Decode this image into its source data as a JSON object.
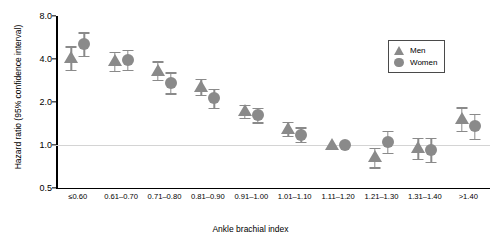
{
  "chart_data": {
    "type": "scatter",
    "title": "",
    "xlabel": "Ankle brachial index",
    "ylabel": "Hazard ratio (95% confidence interval)",
    "yscale": "log",
    "ylim": [
      0.5,
      8.0
    ],
    "yticks": [
      0.5,
      1.0,
      2.0,
      4.0,
      8.0
    ],
    "ytick_labels": [
      "0.5",
      "1.0",
      "2.0",
      "4.0",
      "8.0"
    ],
    "gridlines": [
      1.0
    ],
    "grid": false,
    "legend_position": "top-right",
    "reference_category": "1.11-1.20",
    "reference_note": "(Reference)",
    "categories": [
      "≤0.60",
      "0.61–0.70",
      "0.71–0.80",
      "0.81–0.90",
      "0.91–1.00",
      "1.01–1.10",
      "1.11–1.20",
      "1.21–1.30",
      "1.31–1.40",
      ">1.40"
    ],
    "series": [
      {
        "name": "Men",
        "marker": "triangle",
        "color": "#8a8a8a",
        "values": [
          4.05,
          3.85,
          3.3,
          2.55,
          1.72,
          1.3,
          1.0,
          0.82,
          0.95,
          1.52
        ],
        "ci_low": [
          3.35,
          3.3,
          2.85,
          2.25,
          1.55,
          1.16,
          1.0,
          0.7,
          0.8,
          1.26
        ],
        "ci_high": [
          4.9,
          4.5,
          3.85,
          2.9,
          1.92,
          1.46,
          1.0,
          0.96,
          1.12,
          1.84
        ]
      },
      {
        "name": "Women",
        "marker": "circle",
        "color": "#8a8a8a",
        "values": [
          5.1,
          3.95,
          2.72,
          2.12,
          1.62,
          1.18,
          1.0,
          1.05,
          0.92,
          1.35
        ],
        "ci_low": [
          4.2,
          3.35,
          2.3,
          1.82,
          1.44,
          1.05,
          1.0,
          0.88,
          0.76,
          1.1
        ],
        "ci_high": [
          6.15,
          4.65,
          3.22,
          2.48,
          1.82,
          1.33,
          1.0,
          1.26,
          1.12,
          1.66
        ]
      }
    ]
  },
  "legend": {
    "entries": [
      {
        "label": "Men",
        "marker": "triangle"
      },
      {
        "label": "Women",
        "marker": "circle"
      }
    ]
  }
}
